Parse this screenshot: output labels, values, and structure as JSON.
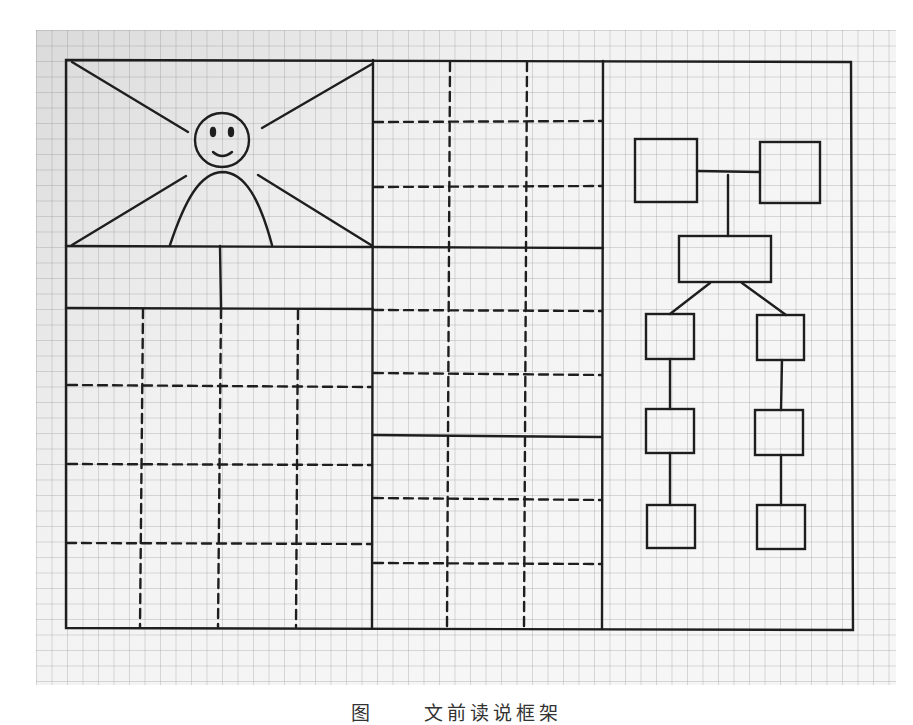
{
  "caption": {
    "figure_label": "图",
    "figure_number": "",
    "title": "文前读说框架"
  },
  "diagram": {
    "stroke_color": "#1e1e1e",
    "paper_grid_color": "#9a9a9a",
    "frame": {
      "x1": 66,
      "y1": 60,
      "x2": 852,
      "y2": 629
    },
    "columns": [
      {
        "name": "left-panel",
        "x1": 66,
        "x2": 373
      },
      {
        "name": "middle-panel",
        "x1": 373,
        "x2": 603
      },
      {
        "name": "right-panel",
        "x1": 603,
        "x2": 852
      }
    ],
    "left_panel": {
      "picture_box": {
        "y1": 60,
        "y2": 246,
        "content": "smiley-figure-with-rays"
      },
      "label_row": {
        "y1": 246,
        "y2": 308,
        "divider_x": 220
      },
      "dashed_grid": {
        "verticals_x": [
          143,
          220,
          298
        ],
        "horizontals_y": [
          385,
          464,
          543
        ]
      }
    },
    "middle_panel": {
      "solid_rows_y": [
        246,
        436
      ],
      "dashed_horizontals_y": [
        122,
        186,
        310,
        373,
        498,
        563
      ],
      "dashed_verticals_x": [
        450,
        527
      ]
    },
    "right_panel": {
      "org_chart": {
        "top_boxes": [
          {
            "x": 635,
            "y": 139,
            "w": 62,
            "h": 63
          },
          {
            "x": 760,
            "y": 142,
            "w": 60,
            "h": 61
          }
        ],
        "middle_box": {
          "x": 679,
          "y": 236,
          "w": 92,
          "h": 46
        },
        "left_chain": [
          {
            "x": 646,
            "y": 314,
            "w": 48,
            "h": 45
          },
          {
            "x": 646,
            "y": 409,
            "w": 48,
            "h": 44
          },
          {
            "x": 647,
            "y": 505,
            "w": 48,
            "h": 43
          }
        ],
        "right_chain": [
          {
            "x": 757,
            "y": 315,
            "w": 47,
            "h": 45
          },
          {
            "x": 755,
            "y": 410,
            "w": 48,
            "h": 45
          },
          {
            "x": 757,
            "y": 505,
            "w": 48,
            "h": 44
          }
        ]
      }
    }
  }
}
